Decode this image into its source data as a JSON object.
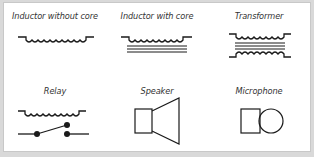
{
  "diagram": {
    "stroke_color": "#1a1a1a",
    "symbols": [
      {
        "id": "inductor-without-core",
        "label": "Inductor without core"
      },
      {
        "id": "inductor-with-core",
        "label": "Inductor with core"
      },
      {
        "id": "transformer",
        "label": "Transformer"
      },
      {
        "id": "relay",
        "label": "Relay"
      },
      {
        "id": "speaker",
        "label": "Speaker"
      },
      {
        "id": "microphone",
        "label": "Microphone"
      }
    ]
  }
}
